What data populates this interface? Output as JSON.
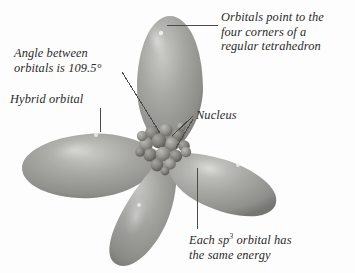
{
  "figure": {
    "background_color": "#fdfdfd",
    "orbital_color": "#9a9a98",
    "orbital_shadow_color": "#6e6e6c",
    "orbital_highlight_color": "#d8d8d4",
    "nucleus_color": "#8c8a86",
    "leader_line_color": "#4a4a4a",
    "text_color": "#2b2b2b"
  },
  "annotations": {
    "tetrahedron": {
      "line1": "Orbitals point to the",
      "line2": "four corners of a",
      "line3": "regular tetrahedron",
      "leader": "horizontal"
    },
    "angle": {
      "line1": "Angle between",
      "line2": "orbitals is 109.5°",
      "leader": "diagonal"
    },
    "hybrid_orbital": {
      "line1": "Hybrid orbital",
      "leader": "vertical"
    },
    "nucleus": {
      "line1": "Nucleus",
      "leader": "diagonal-double"
    },
    "energy": {
      "line1_pre": "Each sp",
      "line1_sup": "3",
      "line1_post": " orbital has",
      "line2": "the same energy",
      "leader": "vertical"
    }
  },
  "structure": {
    "lobe_count": 4,
    "bond_angle": "109.5°",
    "lobes": [
      {
        "name": "top-lobe",
        "direction": "up"
      },
      {
        "name": "left-lobe",
        "direction": "left"
      },
      {
        "name": "bottom-lobe",
        "direction": "down"
      },
      {
        "name": "right-lobe",
        "direction": "right"
      }
    ],
    "nucleus_sphere_count": 17
  }
}
